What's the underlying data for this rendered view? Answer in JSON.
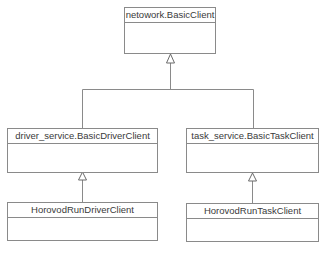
{
  "diagram": {
    "type": "uml-class-inheritance",
    "colors": {
      "line": "#8a8a8a",
      "text": "#3a3a3a",
      "background": "#ffffff"
    },
    "classes": [
      {
        "id": "basic_client",
        "name": "netowork.BasicClient"
      },
      {
        "id": "basic_driver_client",
        "name": "driver_service.BasicDriverClient"
      },
      {
        "id": "basic_task_client",
        "name": "task_service.BasicTaskClient"
      },
      {
        "id": "horovod_run_driver_client",
        "name": "HorovodRunDriverClient"
      },
      {
        "id": "horovod_run_task_client",
        "name": "HorovodRunTaskClient"
      }
    ],
    "relations": [
      {
        "type": "generalization",
        "from": "basic_driver_client",
        "to": "basic_client"
      },
      {
        "type": "generalization",
        "from": "basic_task_client",
        "to": "basic_client"
      },
      {
        "type": "generalization",
        "from": "horovod_run_driver_client",
        "to": "basic_driver_client"
      },
      {
        "type": "generalization",
        "from": "horovod_run_task_client",
        "to": "basic_task_client"
      }
    ]
  }
}
